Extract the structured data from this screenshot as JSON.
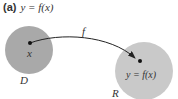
{
  "title": {
    "label": "(a)",
    "equation": "y = f(x)"
  },
  "diagram": {
    "domain_set": {
      "name": "D",
      "point_label": "x",
      "color": "#a9a9a9"
    },
    "range_set": {
      "name": "R",
      "point_label": "y = f(x)",
      "color": "#c9c9c9"
    },
    "arrow_label": "f"
  }
}
